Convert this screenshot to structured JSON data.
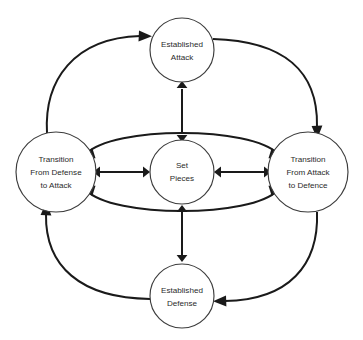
{
  "figure": {
    "type": "cycle-diagram",
    "title": "",
    "background_color": "#ffffff",
    "node_stroke_color": "#3c3c3c",
    "edge_color": "#1a1a1a",
    "label_color": "#2b2b2b"
  },
  "nodes": [
    {
      "id": "established-attack",
      "position": "top",
      "label_lines": [
        "Established",
        "Attack"
      ],
      "line1": "Established",
      "line2": "Attack",
      "cx": 182,
      "cy": 50,
      "r": 32
    },
    {
      "id": "transition-defense-to-attack",
      "position": "left",
      "label_lines": [
        "Transition",
        "From Defense",
        "to Attack"
      ],
      "line1": "Transition",
      "line2": "From Defense",
      "line3": "to Attack",
      "cx": 56,
      "cy": 172,
      "r": 40
    },
    {
      "id": "set-pieces",
      "position": "center",
      "label_lines": [
        "Set",
        "Pieces"
      ],
      "line1": "Set",
      "line2": "Pieces",
      "cx": 182,
      "cy": 172,
      "r": 32
    },
    {
      "id": "transition-attack-to-defence",
      "position": "right",
      "label_lines": [
        "Transition",
        "From Attack",
        "to Defence"
      ],
      "line1": "Transition",
      "line2": "From Attack",
      "line3": "to Defence",
      "cx": 308,
      "cy": 172,
      "r": 40
    },
    {
      "id": "established-defense",
      "position": "bottom",
      "label_lines": [
        "Established",
        "Defense"
      ],
      "line1": "Established",
      "line2": "Defense",
      "cx": 182,
      "cy": 296,
      "r": 32
    }
  ],
  "edges": [
    {
      "id": "attack-center",
      "from": "established-attack",
      "to": "set-pieces",
      "style": "straight",
      "direction": "bidirectional"
    },
    {
      "id": "center-defense",
      "from": "set-pieces",
      "to": "established-defense",
      "style": "straight",
      "direction": "bidirectional"
    },
    {
      "id": "left-center",
      "from": "transition-defense-to-attack",
      "to": "set-pieces",
      "style": "straight",
      "direction": "bidirectional"
    },
    {
      "id": "center-right",
      "from": "set-pieces",
      "to": "transition-attack-to-defence",
      "style": "straight",
      "direction": "bidirectional"
    },
    {
      "id": "inner-upper-arc",
      "from": "transition-defense-to-attack",
      "to": "transition-attack-to-defence",
      "style": "curve-over-center",
      "direction": "bidirectional"
    },
    {
      "id": "inner-lower-arc",
      "from": "transition-defense-to-attack",
      "to": "transition-attack-to-defence",
      "style": "curve-under-center",
      "direction": "bidirectional"
    },
    {
      "id": "outer-left-to-attack",
      "from": "transition-defense-to-attack",
      "to": "established-attack",
      "style": "outer-curve",
      "direction": "unidirectional"
    },
    {
      "id": "outer-attack-to-right",
      "from": "established-attack",
      "to": "transition-attack-to-defence",
      "style": "outer-curve",
      "direction": "unidirectional"
    },
    {
      "id": "outer-right-to-defense",
      "from": "transition-attack-to-defence",
      "to": "established-defense",
      "style": "outer-curve",
      "direction": "unidirectional"
    },
    {
      "id": "outer-defense-to-left",
      "from": "established-defense",
      "to": "transition-defense-to-attack",
      "style": "outer-curve",
      "direction": "unidirectional"
    }
  ]
}
